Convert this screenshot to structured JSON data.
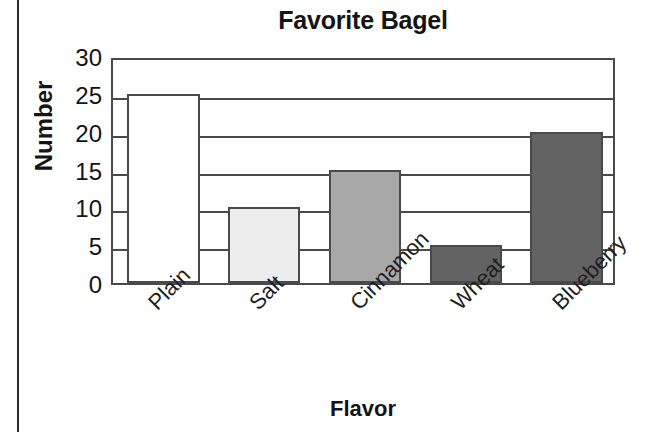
{
  "chart_data": {
    "type": "bar",
    "title": "Favorite Bagel",
    "xlabel": "Flavor",
    "ylabel": "Number",
    "categories": [
      "Plain",
      "Salt",
      "Cinnamon",
      "Wheat",
      "Blueberry"
    ],
    "values": [
      25,
      10,
      15,
      5,
      20
    ],
    "ylim": [
      0,
      30
    ],
    "yticks": [
      30,
      25,
      20,
      15,
      10,
      5,
      0
    ],
    "ytick_labels": [
      "30",
      "25",
      "20",
      "15",
      "10",
      "5",
      "0"
    ],
    "grid": true,
    "legend": false,
    "bar_colors": [
      "#ffffff",
      "#ededed",
      "#a8a8a8",
      "#636363",
      "#636363"
    ],
    "bar_edge_color": "#4a4a4a",
    "frame_color": "#4a4a4a",
    "background": "#ffffff",
    "bars": [
      {
        "label": "Plain",
        "value": 25,
        "fill": "#ffffff"
      },
      {
        "label": "Salt",
        "value": 10,
        "fill": "#ededed"
      },
      {
        "label": "Cinnamon",
        "value": 15,
        "fill": "#a8a8a8"
      },
      {
        "label": "Wheat",
        "value": 5,
        "fill": "#636363"
      },
      {
        "label": "Blueberry",
        "value": 20,
        "fill": "#636363"
      }
    ]
  }
}
